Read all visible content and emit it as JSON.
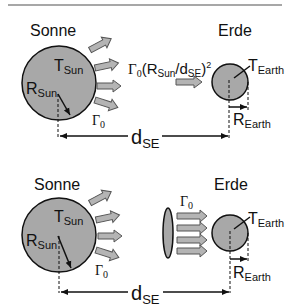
{
  "colors": {
    "body_fill": "#a8a8a8",
    "body_stroke": "#111111",
    "arrow_fill": "#b4b4b4",
    "arrow_stroke": "#555555",
    "rule": "#8a8a8a"
  },
  "panels": [
    {
      "sun_label": "Sonne",
      "earth_label": "Erde",
      "t_sun": {
        "main": "T",
        "sub": "Sun"
      },
      "r_sun": {
        "main": "R",
        "sub": "Sun"
      },
      "gamma0": {
        "main": "Γ",
        "sub": "0"
      },
      "t_earth": {
        "main": "T",
        "sub": "Earth"
      },
      "r_earth": {
        "main": "R",
        "sub": "Earth"
      },
      "d_se": {
        "main": "d",
        "sub": "SE"
      },
      "flux_formula": {
        "g": "Γ",
        "g_sub": "0",
        "open": "(R",
        "rsub": "Sun",
        "slash": "/d",
        "dsub": "SE",
        "close": ")",
        "sup": "2"
      }
    },
    {
      "sun_label": "Sonne",
      "earth_label": "Erde",
      "t_sun": {
        "main": "T",
        "sub": "Sun"
      },
      "r_sun": {
        "main": "R",
        "sub": "Sun"
      },
      "gamma0": {
        "main": "Γ",
        "sub": "0"
      },
      "gamma0_beam": {
        "main": "Γ",
        "sub": "0"
      },
      "t_earth": {
        "main": "T",
        "sub": "Earth"
      },
      "r_earth": {
        "main": "R",
        "sub": "Earth"
      },
      "d_se": {
        "main": "d",
        "sub": "SE"
      }
    }
  ]
}
